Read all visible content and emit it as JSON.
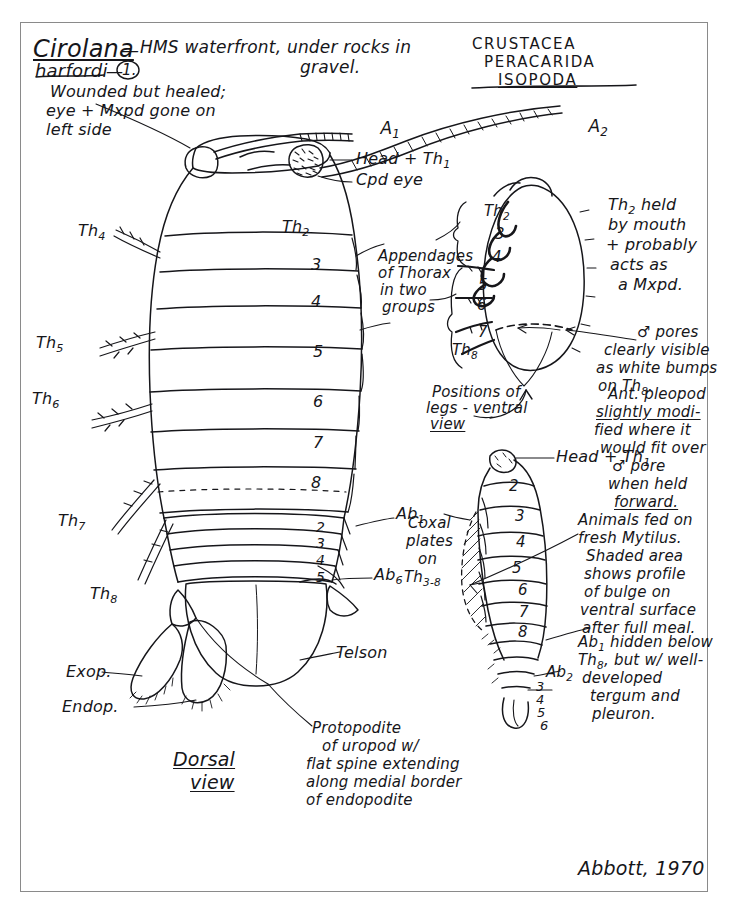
{
  "page": {
    "background_color": "#ffffff",
    "ink_color": "#16161a",
    "border_color": "#8a8a8a"
  },
  "header": {
    "genus": "Cirolana",
    "species": "harfordi",
    "specimen_number": "1.",
    "dash": "—",
    "locality_line1": "HMS waterfront, under rocks in",
    "locality_line2": "gravel.",
    "condition_line1": "Wounded but healed;",
    "condition_line2": "eye + Mxpd gone on",
    "condition_line3": "left side"
  },
  "taxonomy": {
    "line1": "CRUSTACEA",
    "line2": "PERACARIDA",
    "line3": "ISOPODA"
  },
  "dorsal_view": {
    "caption_line1": "Dorsal",
    "caption_line2": "view",
    "antenna_1": "A1",
    "antenna_2": "A2",
    "head_label": "Head + Th1",
    "eye_label": "Cpd eye",
    "telson_label": "Telson",
    "exopodite_label": "Exop.",
    "endopodite_label": "Endop.",
    "abdomen_first": "Ab1",
    "abdomen_last": "Ab6",
    "uropod_note_line1": "Protopodite",
    "uropod_note_line2": "of uropod w/",
    "uropod_note_line3": "flat spine extending",
    "uropod_note_line4": "along medial border",
    "uropod_note_line5": "of endopodite",
    "segment_labels": [
      "Th2",
      "3",
      "4",
      "5",
      "6",
      "7",
      "8"
    ],
    "abdominal_labels": [
      "2",
      "3",
      "4",
      "5"
    ],
    "left_side_labels": [
      "Th4",
      "Th5",
      "Th6",
      "Th7",
      "Th8"
    ]
  },
  "ventral_view": {
    "caption_line1": "Positions of",
    "caption_line2": "legs - ventral",
    "caption_line3": "view",
    "segment_labels": [
      "Th2",
      "3",
      "4",
      "5",
      "6",
      "7",
      "Th8"
    ],
    "bracket_note_line1": "Appendages",
    "bracket_note_line2": "of Thorax",
    "bracket_note_line3": "in two",
    "bracket_note_line4": "groups",
    "maxilliped_note_line1": "Th2 held",
    "maxilliped_note_line2": "by mouth",
    "maxilliped_note_line3": "+ probably",
    "maxilliped_note_line4": "acts as",
    "maxilliped_note_line5": "a Mxpd.",
    "pore_note_line1": "♂ pores",
    "pore_note_line2": "clearly visible",
    "pore_note_line3": "as white bumps",
    "pore_note_line4": "on Th8.",
    "pleopod_note_line1": "Ant. pleopod",
    "pleopod_note_line2": "slightly modi-",
    "pleopod_note_line3": "fied where it",
    "pleopod_note_line4": "would fit over",
    "pleopod_note_line5": "♂ pore",
    "pleopod_note_line6": "when held",
    "pleopod_note_line7": "forward."
  },
  "lateral_view": {
    "head_label": "Head + Th1",
    "segment_labels": [
      "2",
      "3",
      "4",
      "5",
      "6",
      "7",
      "8"
    ],
    "abdominal_label": "Ab2",
    "abdominal_labels": [
      "3",
      "4",
      "5",
      "6"
    ],
    "coxal_note_line1": "Coxal",
    "coxal_note_line2": "plates",
    "coxal_note_line3": "on",
    "coxal_note_line4": "Th3-8",
    "feeding_note_line1": "Animals fed on",
    "feeding_note_line2": "fresh Mytilus.",
    "feeding_note_line3": "Shaded area",
    "feeding_note_line4": "shows profile",
    "feeding_note_line5": "of bulge on",
    "feeding_note_line6": "ventral surface",
    "feeding_note_line7": "after full meal.",
    "ab1_note_line1": "Ab1 hidden below",
    "ab1_note_line2": "Th8, but w/ well-",
    "ab1_note_line3": "developed",
    "ab1_note_line4": "tergum and",
    "ab1_note_line5": "pleuron."
  },
  "signature": {
    "text": "Abbott, 1970"
  }
}
